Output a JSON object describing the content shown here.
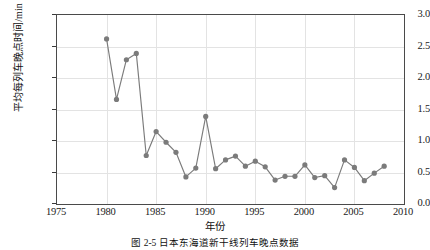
{
  "figure": {
    "caption": "图 2-5   日本东海道新干线列车晚点数据",
    "xlabel": "年份",
    "ylabel": "平均每列车晚点时间/min"
  },
  "axes": {
    "y_ticks": [
      "0.0",
      "0.5",
      "1.0",
      "1.5",
      "2.0",
      "2.5",
      "3.0"
    ],
    "x_ticks": [
      "1975",
      "1980",
      "1985",
      "1990",
      "1995",
      "2000",
      "2005",
      "2010"
    ]
  },
  "style": {
    "marker_color": "#7b7b7b",
    "line_color": "#7b7b7b",
    "grid_color": "#e3e3e3",
    "frame_color": "#4a4a4a"
  },
  "chart_data": {
    "type": "line",
    "title": "",
    "xlabel": "年份",
    "ylabel": "平均每列车晚点时间/min",
    "xlim": [
      1975,
      2010
    ],
    "ylim": [
      0.0,
      3.0
    ],
    "xticks": [
      1975,
      1980,
      1985,
      1990,
      1995,
      2000,
      2005,
      2010
    ],
    "yticks": [
      0.0,
      0.5,
      1.0,
      1.5,
      2.0,
      2.5,
      3.0
    ],
    "grid": true,
    "legend": "none",
    "marker": "circle",
    "x": [
      1980,
      1981,
      1982,
      1983,
      1984,
      1985,
      1986,
      1987,
      1988,
      1989,
      1990,
      1991,
      1992,
      1993,
      1994,
      1995,
      1996,
      1997,
      1998,
      1999,
      2000,
      2001,
      2002,
      2003,
      2004,
      2005,
      2006,
      2007,
      2008
    ],
    "values": [
      2.62,
      1.66,
      2.29,
      2.39,
      0.77,
      1.15,
      0.98,
      0.82,
      0.43,
      0.57,
      1.39,
      0.56,
      0.7,
      0.76,
      0.6,
      0.68,
      0.59,
      0.38,
      0.44,
      0.44,
      0.62,
      0.42,
      0.45,
      0.26,
      0.7,
      0.58,
      0.37,
      0.49,
      0.6
    ]
  }
}
